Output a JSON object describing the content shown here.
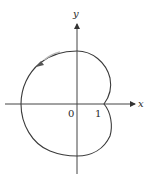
{
  "figure": {
    "type": "polar-curve-diagram",
    "axes": {
      "x_label": "x",
      "y_label": "y",
      "origin_label": "0",
      "tick_labels": [
        "1"
      ]
    },
    "curve": {
      "description": "closed dimpled-limaçon-style curve with cusp at x=1 on positive x-axis",
      "direction_arrow": "counterclockwise, upper-left"
    },
    "colors": {
      "axis": "#333333",
      "curve": "#3a3a3a",
      "background": "#ffffff"
    }
  }
}
